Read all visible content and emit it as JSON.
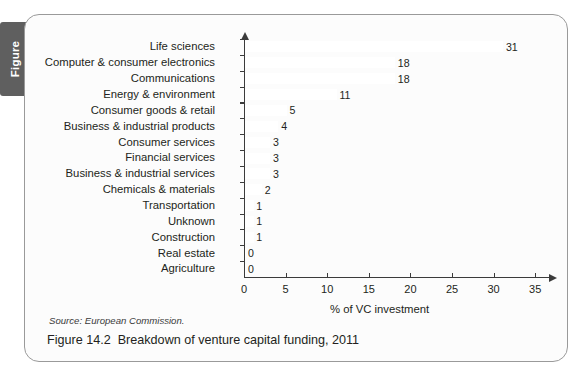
{
  "tab": {
    "label": "Figure"
  },
  "caption": {
    "number": "Figure 14.2",
    "title": "Breakdown of venture capital funding, 2011",
    "source": "Source: European Commission."
  },
  "chart_data": {
    "type": "bar",
    "orientation": "horizontal",
    "title": "",
    "subtitle": "",
    "xlabel": "% of VC investment",
    "ylabel": "",
    "xlim": [
      0,
      35
    ],
    "xticks": [
      0,
      5,
      10,
      15,
      20,
      25,
      30,
      35
    ],
    "xtick_labels": [
      "0",
      "5",
      "10",
      "15",
      "20",
      "25",
      "30",
      "35"
    ],
    "grid": false,
    "legend": false,
    "legend_position": "none",
    "bar_color": "#ffffff",
    "axis_color": "#3b3b3b",
    "data_labels": true,
    "categories": [
      "Life sciences",
      "Computer & consumer electronics",
      "Communications",
      "Energy & environment",
      "Consumer goods & retail",
      "Business & industrial products",
      "Consumer services",
      "Financial services",
      "Business & industrial services",
      "Chemicals & materials",
      "Transportation",
      "Unknown",
      "Construction",
      "Real estate",
      "Agriculture"
    ],
    "values": [
      31,
      18,
      18,
      11,
      5,
      4,
      3,
      3,
      3,
      2,
      1,
      1,
      1,
      0,
      0
    ],
    "value_labels": [
      "31",
      "18",
      "18",
      "11",
      "5",
      "4",
      "3",
      "3",
      "3",
      "2",
      "1",
      "1",
      "1",
      "0",
      "0"
    ]
  }
}
